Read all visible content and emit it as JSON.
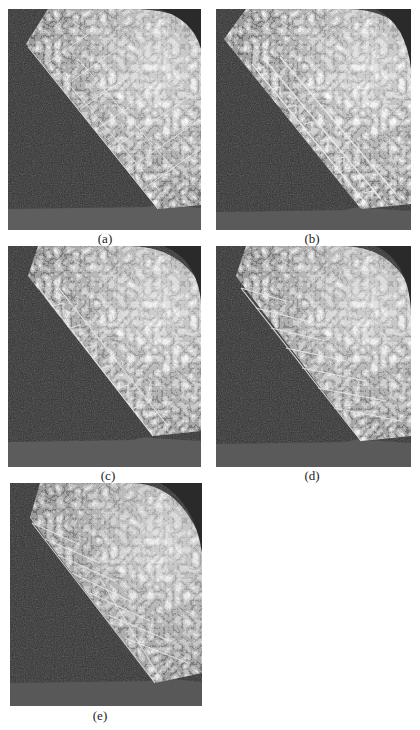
{
  "figure": {
    "panels": [
      {
        "id": "a",
        "label": "(a)"
      },
      {
        "id": "b",
        "label": "(b)"
      },
      {
        "id": "c",
        "label": "(c)"
      },
      {
        "id": "d",
        "label": "(d)"
      },
      {
        "id": "e",
        "label": "(e)"
      }
    ],
    "colors": {
      "background": "#ffffff",
      "dark_region": "#2e2e2e",
      "floor_band": "#5a5a5a",
      "surface_light": "#d8d8d8",
      "grid_lines": "#e6e6e6"
    }
  }
}
